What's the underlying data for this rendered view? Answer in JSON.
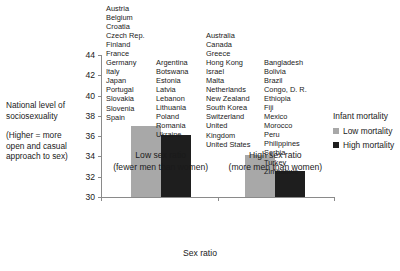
{
  "chart_data": {
    "type": "bar",
    "title": "",
    "xlabel": "Sex ratio",
    "ylabel": "National level of sociosexuality",
    "ylabel_note": "(Higher = more open and casual approach to sex)",
    "categories": [
      "Low sex ratio",
      "High sex ratio"
    ],
    "category_sublabels": [
      "(fewer men than women)",
      "(more men than women)"
    ],
    "series": [
      {
        "name": "Low mortality",
        "color": "#a8a8a8",
        "values": [
          37.0,
          34.1
        ]
      },
      {
        "name": "High mortality",
        "color": "#1e1e1e",
        "values": [
          36.1,
          32.6
        ]
      }
    ],
    "ylim": [
      30,
      44
    ],
    "yticks": [
      30,
      32,
      34,
      36,
      38,
      40,
      42,
      44
    ],
    "ytick_labels": [
      "30",
      "32",
      "34",
      "36",
      "38",
      "40",
      "42",
      "44"
    ],
    "grid": false,
    "legend_title": "Infant mortality",
    "legend_position": "right"
  },
  "axis": {
    "y_title_line1": "National level of",
    "y_title_line2": "sociosexuality",
    "y_note_line1": "(Higher = more",
    "y_note_line2": "open and casual",
    "y_note_line3": "approach to sex)",
    "x_title": "Sex ratio",
    "ticks": [
      "44",
      "42",
      "40",
      "38",
      "36",
      "34",
      "32",
      "30"
    ]
  },
  "groups": [
    {
      "name": "Low sex ratio",
      "sub": "(fewer men than women)"
    },
    {
      "name": "High sex ratio",
      "sub": "(more men than women)"
    }
  ],
  "legend": {
    "title": "Infant mortality",
    "items": [
      {
        "label": "Low mortality",
        "color": "#a8a8a8"
      },
      {
        "label": "High mortality",
        "color": "#1e1e1e"
      }
    ]
  },
  "country_columns": [
    {
      "id": "low-sexratio-low-mortality",
      "countries": [
        "Austria",
        "Belgium",
        "Croatia",
        "Czech Rep.",
        "Finland",
        "France",
        "Germany",
        "Italy",
        "Japan",
        "Portugal",
        "Slovakia",
        "Slovenia",
        "Spain"
      ]
    },
    {
      "id": "low-sexratio-high-mortality",
      "countries": [
        "Argentina",
        "Botswana",
        "Estonia",
        "Latvia",
        "Lebanon",
        "Lithuania",
        "Poland",
        "Romania",
        "Ukraine"
      ]
    },
    {
      "id": "high-sexratio-low-mortality",
      "countries": [
        "Australia",
        "Canada",
        "Greece",
        "Hong Kong",
        "Israel",
        "Malta",
        "Netherlands",
        "New Zealand",
        "South Korea",
        "Switzerland",
        "United",
        "Kingdom",
        "United States"
      ]
    },
    {
      "id": "high-sexratio-high-mortality",
      "countries": [
        "Bangladesh",
        "Bolivia",
        "Brazil",
        "Congo, D. R.",
        "Ethiopia",
        "Fiji",
        "Mexico",
        "Morocco",
        "Peru",
        "Philippines",
        "Serbia",
        "Turkey",
        "Zimbabwe"
      ]
    }
  ]
}
